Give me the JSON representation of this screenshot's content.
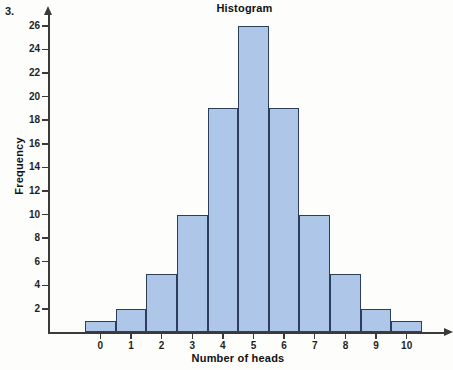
{
  "item_number": "3.",
  "chart_data": {
    "type": "bar",
    "title": "Histogram",
    "xlabel": "Number of heads",
    "ylabel": "Frequency",
    "categories": [
      "0",
      "1",
      "2",
      "3",
      "4",
      "5",
      "6",
      "7",
      "8",
      "9",
      "10"
    ],
    "values": [
      1,
      2,
      5,
      10,
      19,
      26,
      19,
      10,
      5,
      2,
      1
    ],
    "ylim": [
      0,
      27
    ],
    "ytick_labels": [
      "2",
      "4",
      "6",
      "8",
      "10",
      "12",
      "14",
      "16",
      "18",
      "20",
      "22",
      "24",
      "26"
    ],
    "ytick_values": [
      2,
      4,
      6,
      8,
      10,
      12,
      14,
      16,
      18,
      20,
      22,
      24,
      26
    ],
    "grid": false,
    "legend": "none",
    "bar_fill_color": "#aec6e8",
    "bar_edge_color": "#2c3e5c",
    "axis_color": "#3a3a3a",
    "axis_arrows": true,
    "bar_gap": 0
  }
}
